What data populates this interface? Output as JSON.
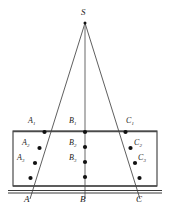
{
  "figure": {
    "type": "geometry-diagram",
    "canvas": {
      "width": 170,
      "height": 212
    },
    "background_color": "#ffffff",
    "line_color": "#4d4d4d",
    "dot_color": "#111111",
    "apex": {
      "name": "S",
      "label": "S",
      "label_x": 81,
      "label_y": 9,
      "x": 85,
      "y": 23
    },
    "rectangle": {
      "name": "plane-rectangle",
      "x": 13,
      "y": 131,
      "width": 144,
      "height": 55,
      "stroke_color": "#3a3a3a"
    },
    "ground_line": {
      "name": "base-line",
      "x1": 8,
      "y1": 191,
      "x2": 162,
      "y2": 191,
      "x1b": 8,
      "y1b": 193,
      "x2b": 162,
      "y2b": 193
    },
    "rays": [
      {
        "name": "ray-SA",
        "x1": 85,
        "y1": 23,
        "x2": 30,
        "y2": 199,
        "dots": [
          {
            "label": "A1",
            "base": "A",
            "sub": "1",
            "x": 44.5,
            "y": 132,
            "label_x": 28,
            "label_y": 119,
            "label_align": "left"
          },
          {
            "label": "A2",
            "base": "A",
            "sub": "2",
            "x": 39.5,
            "y": 148,
            "label_x": 23,
            "label_y": 141,
            "label_align": "left"
          },
          {
            "label": "A3",
            "base": "A",
            "sub": "3",
            "x": 35.0,
            "y": 163,
            "label_x": 19,
            "label_y": 156,
            "label_align": "left"
          },
          {
            "label": "",
            "base": "",
            "sub": "",
            "x": 30.5,
            "y": 178,
            "label_x": 0,
            "label_y": 0,
            "label_align": "none"
          }
        ],
        "base_label": "A",
        "base_label_x": 25,
        "base_label_y": 196
      },
      {
        "name": "ray-SB",
        "x1": 85,
        "y1": 23,
        "x2": 85,
        "y2": 199,
        "dots": [
          {
            "label": "B1",
            "base": "B",
            "sub": "1",
            "x": 85,
            "y": 132,
            "label_x": 70,
            "label_y": 119,
            "label_align": "left"
          },
          {
            "label": "B2",
            "base": "B",
            "sub": "2",
            "x": 85,
            "y": 147,
            "label_x": 70,
            "label_y": 140,
            "label_align": "left"
          },
          {
            "label": "B3",
            "base": "B",
            "sub": "3",
            "x": 85,
            "y": 162,
            "label_x": 70,
            "label_y": 155,
            "label_align": "left"
          },
          {
            "label": "",
            "base": "",
            "sub": "",
            "x": 85,
            "y": 177,
            "label_x": 0,
            "label_y": 0,
            "label_align": "none"
          }
        ],
        "base_label": "B",
        "base_label_x": 80,
        "base_label_y": 196
      },
      {
        "name": "ray-SC",
        "x1": 85,
        "y1": 23,
        "x2": 140,
        "y2": 199,
        "dots": [
          {
            "label": "C1",
            "base": "C",
            "sub": "1",
            "x": 125.5,
            "y": 132,
            "label_x": 126,
            "label_y": 119,
            "label_align": "left"
          },
          {
            "label": "C2",
            "base": "C",
            "sub": "2",
            "x": 130.5,
            "y": 148,
            "label_x": 134,
            "label_y": 141,
            "label_align": "left"
          },
          {
            "label": "C3",
            "base": "C",
            "sub": "3",
            "x": 135.0,
            "y": 163,
            "label_x": 138,
            "label_y": 156,
            "label_align": "left"
          },
          {
            "label": "",
            "base": "",
            "sub": "",
            "x": 139.5,
            "y": 178,
            "label_x": 0,
            "label_y": 0,
            "label_align": "none"
          }
        ],
        "base_label": "C",
        "base_label_x": 137,
        "base_label_y": 196
      }
    ],
    "labels": {
      "apex": "S",
      "a1": "A",
      "a1_sub": "1",
      "a2": "A",
      "a2_sub": "2",
      "a3": "A",
      "a3_sub": "3",
      "b1": "B",
      "b1_sub": "1",
      "b2": "B",
      "b2_sub": "2",
      "b3": "B",
      "b3_sub": "3",
      "c1": "C",
      "c1_sub": "1",
      "c2": "C",
      "c2_sub": "2",
      "c3": "C",
      "c3_sub": "3",
      "base_a": "A",
      "base_b": "B",
      "base_c": "C"
    }
  }
}
